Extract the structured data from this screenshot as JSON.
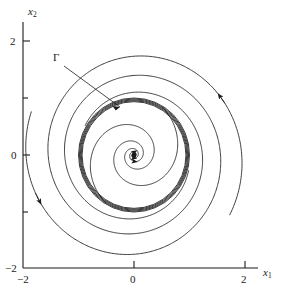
{
  "figure": {
    "type": "phase-portrait",
    "background_color": "#ffffff",
    "line_color": "#1a1a1a"
  },
  "axes": {
    "x": {
      "name": "x",
      "subscript": "1",
      "label_text": "x1",
      "range": [
        -2.2,
        2.4
      ],
      "ticks": [
        {
          "value": -2,
          "label": "−2",
          "major": true
        },
        {
          "value": -1,
          "label": "",
          "major": false
        },
        {
          "value": 0,
          "label": "0",
          "major": true
        },
        {
          "value": 1,
          "label": "",
          "major": false
        },
        {
          "value": 2,
          "label": "2",
          "major": true
        }
      ]
    },
    "y": {
      "name": "x",
      "subscript": "2",
      "label_text": "x2",
      "range": [
        -2.2,
        2.4
      ],
      "ticks": [
        {
          "value": 2,
          "label": "2",
          "major": true
        },
        {
          "value": 1,
          "label": "",
          "major": false
        },
        {
          "value": 0,
          "label": "0",
          "major": true
        },
        {
          "value": -1,
          "label": "",
          "major": false
        },
        {
          "value": -2,
          "label": "−2",
          "major": true
        }
      ]
    }
  },
  "annotations": {
    "limit_cycle": {
      "label": "Γ",
      "label_x": -1.6,
      "label_y": 1.75,
      "leader_to_x": -0.25,
      "leader_to_y": 0.85
    }
  },
  "chart_data": {
    "type": "line",
    "title": "",
    "xlabel": "x1",
    "ylabel": "x2",
    "xlim": [
      -2.2,
      2.4
    ],
    "ylim": [
      -2.2,
      2.4
    ],
    "grid": false,
    "legend": "none",
    "equilibrium_point": {
      "x": 0.0,
      "y": 0.0,
      "stability": "unstable-focus"
    },
    "limit_cycle": {
      "name": "Γ",
      "stability": "stable",
      "approx_radius": 1.0,
      "center": [
        0.0,
        0.0
      ],
      "direction": "counterclockwise"
    },
    "series": [
      {
        "name": "inner-trajectory-a",
        "description": "spirals outward from the origin toward the limit cycle",
        "spiral": {
          "r_start": 0.035,
          "r_end": 0.985,
          "theta_start": 0.0,
          "theta_end": 13.6,
          "direction": "counterclockwise"
        },
        "arrows": [
          {
            "theta": 1.6
          },
          {
            "theta": 4.8
          }
        ]
      },
      {
        "name": "inner-trajectory-b",
        "description": "second inner spiral, offset by pi, outward to the limit cycle",
        "spiral": {
          "r_start": 0.035,
          "r_end": 0.985,
          "theta_start": 3.1416,
          "theta_end": 16.75,
          "direction": "counterclockwise"
        },
        "arrows": [
          {
            "theta": 4.75
          }
        ]
      },
      {
        "name": "outer-trajectory-a",
        "description": "spirals inward from outside toward the limit cycle",
        "spiral": {
          "r_start": 2.02,
          "r_end": 1.02,
          "theta_start": -0.55,
          "theta_end": 8.9,
          "direction": "counterclockwise"
        },
        "arrows": [
          {
            "theta": 0.55
          }
        ]
      },
      {
        "name": "outer-trajectory-b",
        "description": "second outer spiral inward toward the limit cycle",
        "spiral": {
          "r_start": 2.0,
          "r_end": 1.02,
          "theta_start": 2.75,
          "theta_end": 12.3,
          "direction": "counterclockwise"
        },
        "arrows": [
          {
            "theta": 3.55
          }
        ]
      }
    ]
  }
}
